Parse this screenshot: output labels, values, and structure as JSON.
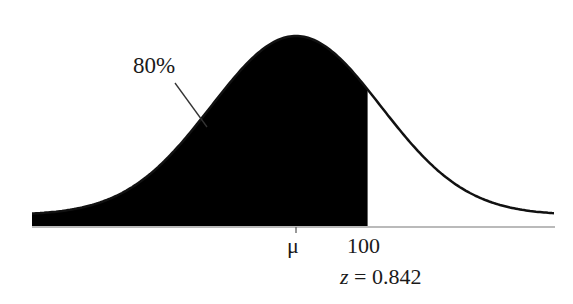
{
  "chart_data": {
    "type": "area",
    "title": "",
    "xlabel": "",
    "ylabel": "",
    "distribution": "normal",
    "mean_label": "μ",
    "cutoff_value": 100,
    "cutoff_label": "100",
    "z_score": 0.842,
    "z_label": "z = 0.842",
    "shaded_region": "left of 100",
    "shaded_area_percent": 80,
    "annotation": "80%",
    "grid": false,
    "fill_color": "#000000",
    "line_color": "#111111"
  },
  "labels": {
    "annotation": "80%",
    "mean": "μ",
    "cutoff": "100",
    "z_prefix": "z",
    "z_rest": " = 0.842"
  }
}
